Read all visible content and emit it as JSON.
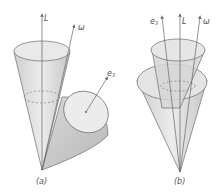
{
  "figure": {
    "panels": [
      {
        "id": "a",
        "caption": "(a)",
        "vectors": [
          {
            "label": "L",
            "description": "vertical axis vector"
          },
          {
            "label": "ω",
            "description": "tilted angular velocity vector"
          },
          {
            "label": "e3",
            "description": "body symmetry axis vector"
          }
        ],
        "shapes": [
          "space cone (upright)",
          "body cone (rolling outside)"
        ]
      },
      {
        "id": "b",
        "caption": "(b)",
        "vectors": [
          {
            "label": "e3",
            "description": "body symmetry axis vector"
          },
          {
            "label": "L",
            "description": "vertical axis vector"
          },
          {
            "label": "ω",
            "description": "angular velocity vector"
          }
        ],
        "shapes": [
          "space cone (inside)",
          "body cone (surrounding)"
        ]
      }
    ],
    "colors": {
      "line": "#6b6b6b",
      "fill_light": "#e6e6e6",
      "fill_mid": "#d2d2d2",
      "fill_dark": "#bdbdbd",
      "text": "#555555"
    }
  }
}
